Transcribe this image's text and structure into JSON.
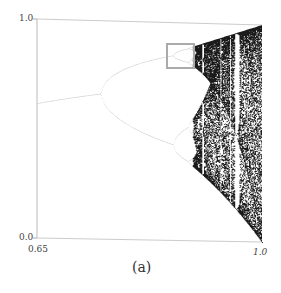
{
  "chart_data": {
    "type": "scatter",
    "title": "",
    "subtitle": "",
    "caption": "(a)",
    "xlabel": "",
    "ylabel": "",
    "xlim": [
      0.65,
      1.0
    ],
    "ylim": [
      0.0,
      1.0
    ],
    "x_ticks": [
      "0.65",
      "1.0"
    ],
    "y_ticks": [
      "0.0",
      "1.0"
    ],
    "grid": false,
    "legend": null,
    "map": "logistic",
    "parameter_range": [
      0.65,
      1.0
    ],
    "features": {
      "first_bifurcation_r": 0.75,
      "second_bifurcation_r": 0.862,
      "onset_of_chaos_r": 0.892,
      "period3_window_r": 0.957,
      "highlight_box": {
        "r_range": [
          0.85,
          0.895
        ],
        "x_range": [
          0.78,
          0.9
        ]
      }
    }
  },
  "labels": {
    "y_top": "1.0",
    "y_bottom": "0.0",
    "x_left": "0.65",
    "x_right": "1.0",
    "caption": "(a)"
  },
  "colors": {
    "axis": "#bbbbbb",
    "branch": "#c8c8c8",
    "chaos": "#1a1a1a",
    "box": "#aaaaaa",
    "text": "#444444"
  }
}
